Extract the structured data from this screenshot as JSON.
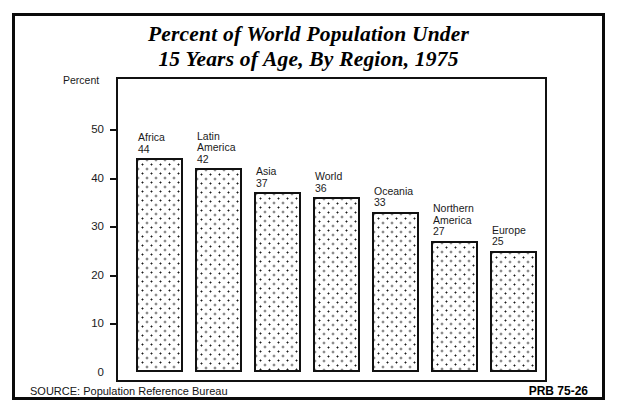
{
  "poster": {
    "title_lines": [
      "Percent of World Population Under",
      "15 Years of Age, By Region, 1975"
    ],
    "axis_caption": "Percent",
    "source_note": "SOURCE: Population Reference Bureau",
    "publication_code": "PRB 75-26",
    "border_color": "#0a0a0a",
    "ink_color": "#111111",
    "paper_color": "#ffffff"
  },
  "chart_data": {
    "type": "bar",
    "title": "Percent of World Population Under 15 Years of Age, By Region, 1975",
    "xlabel": "",
    "ylabel": "Percent",
    "ylim": [
      0,
      55
    ],
    "yticks": [
      0,
      10,
      20,
      30,
      40,
      50
    ],
    "ytick_labels": [
      "0",
      "10",
      "20",
      "30",
      "40",
      "50"
    ],
    "grid": false,
    "legend": "none",
    "categories": [
      "Africa",
      "Latin America",
      "Asia",
      "World",
      "Oceania",
      "Northern America",
      "Europe"
    ],
    "values": [
      44,
      42,
      37,
      36,
      33,
      27,
      25
    ],
    "bars": [
      {
        "label_lines": [
          "Africa"
        ],
        "value": 44,
        "value_text": "44"
      },
      {
        "label_lines": [
          "Latin",
          "America"
        ],
        "value": 42,
        "value_text": "42"
      },
      {
        "label_lines": [
          "Asia"
        ],
        "value": 37,
        "value_text": "37"
      },
      {
        "label_lines": [
          "World"
        ],
        "value": 36,
        "value_text": "36"
      },
      {
        "label_lines": [
          "Oceania"
        ],
        "value": 33,
        "value_text": "33"
      },
      {
        "label_lines": [
          "Northern",
          "America"
        ],
        "value": 27,
        "value_text": "27"
      },
      {
        "label_lines": [
          "Europe"
        ],
        "value": 25,
        "value_text": "25"
      }
    ]
  }
}
